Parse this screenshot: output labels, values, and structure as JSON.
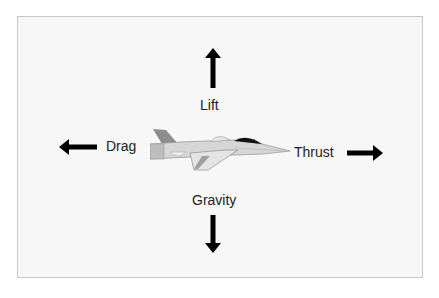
{
  "diagram": {
    "title": "",
    "center_object": "fighter-jet",
    "forces": {
      "lift": {
        "label": "Lift",
        "direction": "up"
      },
      "drag": {
        "label": "Drag",
        "direction": "left"
      },
      "thrust": {
        "label": "Thrust",
        "direction": "right"
      },
      "gravity": {
        "label": "Gravity",
        "direction": "down"
      }
    },
    "colors": {
      "arrow": "#000000",
      "text": "#222222",
      "frame_border": "#c8c8c8",
      "frame_bg": "#f7f7f7",
      "jet_body": "#d9d9d9",
      "jet_dark": "#9a9a9a",
      "canopy": "#111111"
    }
  }
}
